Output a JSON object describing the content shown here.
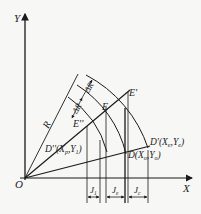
{
  "diagram": {
    "type": "geometric-construction",
    "axes": {
      "x_label": "X",
      "y_label": "Y",
      "origin_label": "O"
    },
    "radius_label": "R",
    "increment_labels": [
      "ΔR",
      "ΔR"
    ],
    "points": {
      "E_double_prime": "E''",
      "E": "E",
      "E_prime": "E'",
      "D_double_prime": "D''(X",
      "D_double_prime_sub1": "p",
      "D_double_prime_mid": ",Y",
      "D_double_prime_sub2": "1",
      "D_double_prime_end": ")",
      "D_prime": "D'(X",
      "D_prime_sub1": "e",
      "D_prime_mid": ",Y",
      "D_prime_sub2": "e",
      "D_prime_end": ")",
      "D": "D(X",
      "D_sub1": "o",
      "D_mid": ",Y",
      "D_sub2": "o",
      "D_end": ")"
    },
    "dimensions": {
      "J1": {
        "main": "J",
        "sub": "1"
      },
      "J2": {
        "main": "J",
        "sub": "e"
      },
      "J3": {
        "main": "J",
        "sub": "c"
      }
    },
    "colors": {
      "line": "#1a1a1a",
      "background": "#f7f7f5"
    }
  }
}
